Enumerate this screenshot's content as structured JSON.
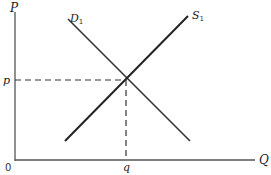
{
  "diagram": {
    "type": "supply-demand",
    "axes": {
      "y_label": "P",
      "x_label": "Q",
      "origin_label": "0"
    },
    "curves": [
      {
        "name": "demand",
        "label": "D",
        "subscript": "1"
      },
      {
        "name": "supply",
        "label": "S",
        "subscript": "1"
      }
    ],
    "equilibrium": {
      "price_label": "p",
      "quantity_label": "q"
    },
    "colors": {
      "line": "#222222",
      "axis": "#555555"
    }
  }
}
